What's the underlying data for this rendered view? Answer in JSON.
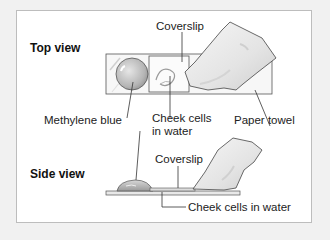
{
  "figure": {
    "type": "labeled-diagram",
    "colors": {
      "background": "#f1f1f1",
      "panel": "#ffffff",
      "panel_border": "#bdbdbd",
      "line": "#333333",
      "shading": "#c8c8c8"
    }
  },
  "top_view": {
    "heading": "Top view",
    "labels": {
      "coverslip": "Coverslip",
      "methylene_blue": "Methylene blue",
      "cheek_cells_line1": "Cheek cells",
      "cheek_cells_line2": "in water",
      "paper_towel": "Paper towel"
    }
  },
  "side_view": {
    "heading": "Side view",
    "labels": {
      "coverslip": "Coverslip",
      "cheek_cells": "Cheek cells in water"
    }
  }
}
